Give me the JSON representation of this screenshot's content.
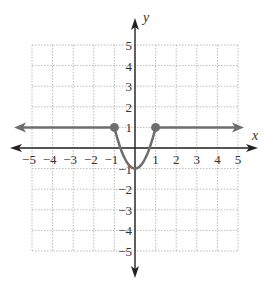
{
  "chart_data": {
    "type": "line",
    "title": "",
    "xlabel": "x",
    "ylabel": "y",
    "xlim": [
      -5,
      5
    ],
    "ylim": [
      -5,
      5
    ],
    "grid": true,
    "x_ticks": [
      "−5",
      "−4",
      "−3",
      "−2",
      "−1",
      "1",
      "2",
      "3",
      "4",
      "5"
    ],
    "y_ticks": [
      "5",
      "4",
      "3",
      "2",
      "1",
      "−1",
      "−2",
      "−3",
      "−4",
      "−5"
    ],
    "series": [
      {
        "name": "left ray",
        "description": "y = 1 for x ≤ −1, arrow to left",
        "points": [
          [
            -5,
            1
          ],
          [
            -1,
            1
          ]
        ]
      },
      {
        "name": "parabola",
        "description": "y = 2x² − 1 on −1 ≤ x ≤ 1",
        "points": [
          [
            -1,
            1
          ],
          [
            -0.5,
            -0.5
          ],
          [
            0,
            -1
          ],
          [
            0.5,
            -0.5
          ],
          [
            1,
            1
          ]
        ]
      },
      {
        "name": "right ray",
        "description": "y = 1 for x ≥ 1, arrow to right",
        "points": [
          [
            1,
            1
          ],
          [
            5,
            1
          ]
        ]
      }
    ],
    "markers": [
      {
        "x": -1,
        "y": 1,
        "style": "closed dot"
      },
      {
        "x": 1,
        "y": 1,
        "style": "closed dot"
      }
    ],
    "colors": {
      "curve": "#6e6e6e",
      "axes": "#222222",
      "grid": "#bbbbbb"
    }
  }
}
